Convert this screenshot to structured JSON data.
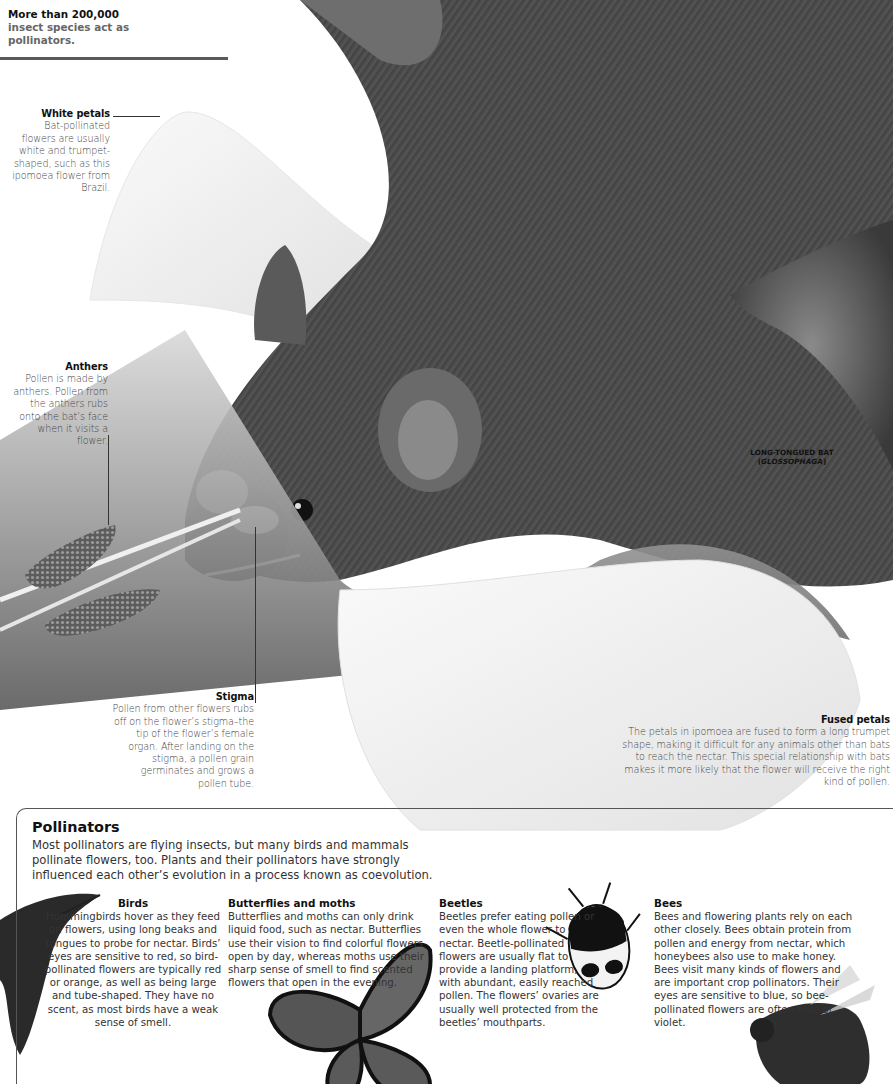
{
  "intro": {
    "highlight": "More than 200,000",
    "rest": " insect species act as pollinators."
  },
  "labels": {
    "white_petals": {
      "title": "White petals",
      "body": "Bat-pollinated flowers are usually white and trumpet-shaped, such as this ipomoea flower from Brazil."
    },
    "anthers": {
      "title": "Anthers",
      "body": "Pollen is made by anthers. Pollen from the anthers rubs onto the bat’s face when it visits a flower."
    },
    "stigma": {
      "title": "Stigma",
      "body": "Pollen from other flowers rubs off on the flower’s stigma–the tip of the flower’s female organ. After landing on the stigma, a pollen grain germinates and grows a pollen tube."
    },
    "fused_petals": {
      "title": "Fused petals",
      "body": "The petals in ipomoea are fused to form a long trumpet shape, making it difficult for any animals other than bats to reach the nectar. This special relationship with bats makes it more likely that the flower will receive the right kind of pollen."
    },
    "species": {
      "name": "LONG-TONGUED BAT",
      "genus": "GLOSSOPHAGA"
    }
  },
  "pollinators": {
    "title": "Pollinators",
    "body": "Most pollinators are flying insects, but many birds and mammals pollinate flowers, too. Plants and their pollinators have strongly influenced each other’s evolution in a process known as coevolution.",
    "cards": [
      {
        "title": "Birds",
        "body": "Hummingbirds hover as they feed on flowers, using long beaks and tongues to probe for nectar. Birds’ eyes are sensitive to red, so bird-pollinated flowers are typically red or orange, as well as being large and tube-shaped. They have no scent, as most birds have a weak sense of smell.",
        "image": "hummingbird"
      },
      {
        "title": "Butterflies and moths",
        "body": "Butterflies and moths can only drink liquid food, such as nectar. Butterflies use their vision to find colorful flowers open by day, whereas moths use their sharp sense of smell to find scented flowers that open in the evening.",
        "image": "monarch-butterfly"
      },
      {
        "title": "Beetles",
        "body": "Beetles prefer eating pollen or even the whole flower to nectar. Beetle-pollinated flowers are usually flat to provide a landing platform, with abundant, easily reached pollen. The flowers’ ovaries are usually well protected from the beetles’ mouthparts.",
        "image": "beetle"
      },
      {
        "title": "Bees",
        "body": "Bees and flowering plants rely on each other closely. Bees obtain protein from pollen and energy from nectar, which honeybees also use to make honey. Bees visit many kinds of flowers and are important crop pollinators. Their eyes are sensitive to blue, so bee-pollinated flowers are often blue or violet.",
        "image": "honeybee"
      }
    ]
  },
  "colors": {
    "bat_fur": "#4a4a4a",
    "bat_fur_dark": "#2c2c2c",
    "petal": "#f2f2f2",
    "text": "#333333",
    "title": "#111111"
  }
}
